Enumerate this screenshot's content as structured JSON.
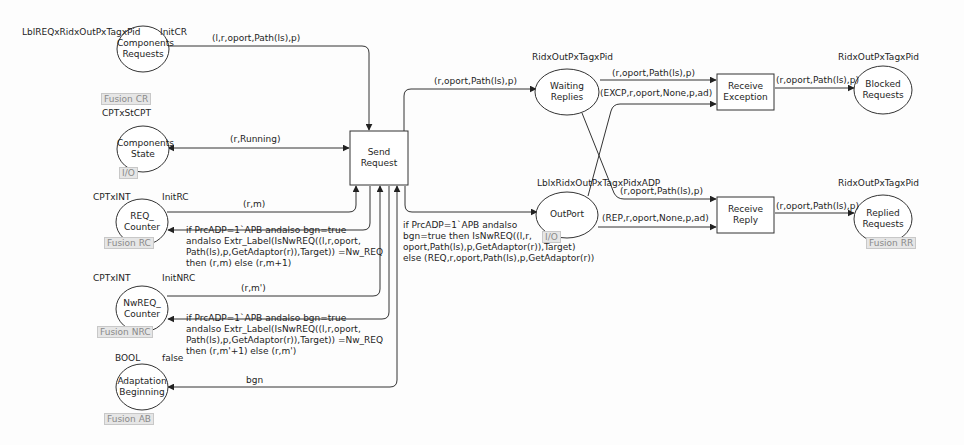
{
  "diagram": {
    "type": "colored-petri-net",
    "places": {
      "components_requests": {
        "name_l1": "Components",
        "name_l2": "Requests",
        "colorset": "LblREQxRidxOutPxTagxPid",
        "init": "InitCR",
        "tag": "Fusion CR"
      },
      "components_state": {
        "name_l1": "Components",
        "name_l2": "State",
        "colorset": "CPTxStCPT",
        "tag": "I/O"
      },
      "req_counter": {
        "name_l1": "REQ_",
        "name_l2": "Counter",
        "colorset": "CPTxINT",
        "init": "InitRC",
        "tag": "Fusion RC"
      },
      "nwreq_counter": {
        "name_l1": "NwREQ_",
        "name_l2": "Counter",
        "colorset": "CPTxINT",
        "init": "InitNRC",
        "tag": "Fusion NRC"
      },
      "adaptation_beginning": {
        "name_l1": "Adaptation",
        "name_l2": "Beginning",
        "colorset": "BOOL",
        "init": "false",
        "tag": "Fusion AB"
      },
      "waiting_replies": {
        "name_l1": "Waiting",
        "name_l2": "Replies",
        "colorset": "RidxOutPxTagxPid"
      },
      "outport": {
        "name_l1": "OutPort",
        "name_l2": "",
        "colorset": "LblxRidxOutPxTagxPidxADP",
        "tag": "I/O"
      },
      "blocked_requests": {
        "name_l1": "Blocked",
        "name_l2": "Requests",
        "colorset": "RidxOutPxTagxPid"
      },
      "replied_requests": {
        "name_l1": "Replied",
        "name_l2": "Requests",
        "colorset": "RidxOutPxTagxPid",
        "tag": "Fusion RR"
      }
    },
    "transitions": {
      "send_request": {
        "name_l1": "Send",
        "name_l2": "Request"
      },
      "receive_exception": {
        "name_l1": "Receive",
        "name_l2": "Exception"
      },
      "receive_reply": {
        "name_l1": "Receive",
        "name_l2": "Reply"
      }
    },
    "arcs": {
      "cr_to_send": "(l,r,oport,Path(ls),p)",
      "state_send": "(r,Running)",
      "rc_to_send": "(r,m)",
      "send_to_rc": "if PrcADP=1`APB andalso bgn=true\nandalso Extr_Label(IsNwREQ((l,r,oport,\nPath(ls),p,GetAdaptor(r)),Target)) =Nw_REQ\nthen (r,m) else (r,m+1)",
      "nrc_to_send": "(r,m')",
      "send_to_nrc": "if PrcADP=1`APB andalso bgn=true\nandalso Extr_Label(IsNwREQ((l,r,oport,\nPath(ls),p,GetAdaptor(r)),Target)) =Nw_REQ\nthen (r,m'+1) else (r,m')",
      "ab_send": "bgn",
      "send_to_wr": "(r,oport,Path(ls),p)",
      "send_to_outport": "if PrcADP=1`APB andalso\nbgn=true then IsNwREQ((l,r,\noport,Path(ls),p,GetAdaptor(r)),Target)\nelse (REQ,r,oport,Path(ls),p,GetAdaptor(r))",
      "wr_to_rexc": "(r,oport,Path(ls),p)",
      "outport_to_rexc": "(EXCP,r,oport,None,p,ad)",
      "rexc_to_blocked": "(r,oport,Path(ls),p)",
      "wr_to_rrep": "(r,oport,Path(ls),p)",
      "outport_to_rrep": "(REP,r,oport,None,p,ad)",
      "rrep_to_replied": "(r,oport,Path(ls),p)"
    }
  }
}
